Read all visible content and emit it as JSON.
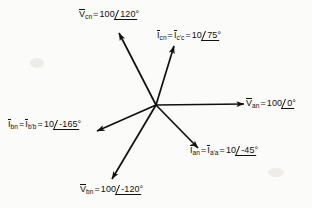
{
  "figure": {
    "type": "phasor-diagram",
    "title": "",
    "origin": {
      "x": 156,
      "y": 105
    },
    "background_color": "#fbfbfa",
    "line_color": "#101010",
    "phasors": [
      {
        "id": "Vcn",
        "quantity": "voltage",
        "symbol": "V",
        "subscript": "cn",
        "magnitude": "100",
        "angle": "120°",
        "label_parts": [
          "V",
          "cn",
          "=",
          "100",
          "120°"
        ],
        "tip": {
          "x": 117,
          "y": 31
        },
        "label_pos": {
          "x": 79,
          "y": 9
        }
      },
      {
        "id": "Icn",
        "quantity": "current",
        "symbol": "I",
        "subscript": "cn",
        "alias_symbol": "I",
        "alias_subscript": "c'c",
        "magnitude": "10",
        "angle": "75°",
        "label_parts": [
          "I",
          "cn",
          "=",
          "I",
          "c'c",
          "=",
          "10",
          "75°"
        ],
        "tip": {
          "x": 173,
          "y": 44
        },
        "label_pos": {
          "x": 157,
          "y": 30
        }
      },
      {
        "id": "Van",
        "quantity": "voltage",
        "symbol": "V",
        "subscript": "an",
        "magnitude": "100",
        "angle": "0°",
        "label_parts": [
          "V",
          "an",
          "=",
          "100",
          "0°"
        ],
        "tip": {
          "x": 243,
          "y": 104
        },
        "label_pos": {
          "x": 245,
          "y": 98
        }
      },
      {
        "id": "Ian",
        "quantity": "current",
        "symbol": "I",
        "subscript": "an",
        "alias_symbol": "I",
        "alias_subscript": "a'a",
        "magnitude": "10",
        "angle": "-45°",
        "label_parts": [
          "I",
          "an",
          "=",
          "I",
          "a'a",
          "=",
          "10",
          "-45°"
        ],
        "tip": {
          "x": 197,
          "y": 147
        },
        "label_pos": {
          "x": 190,
          "y": 145
        }
      },
      {
        "id": "Ibn",
        "quantity": "current",
        "symbol": "I",
        "subscript": "bn",
        "alias_symbol": "I",
        "alias_subscript": "b'b",
        "magnitude": "10",
        "angle": "-165°",
        "label_parts": [
          "I",
          "bn",
          "=",
          "I",
          "b'b",
          "=",
          "10",
          "-165°"
        ],
        "tip": {
          "x": 98,
          "y": 131
        },
        "label_pos": {
          "x": 8,
          "y": 119
        }
      },
      {
        "id": "Vbn",
        "quantity": "voltage",
        "symbol": "V",
        "subscript": "bn",
        "magnitude": "100",
        "angle": "-120°",
        "label_parts": [
          "V",
          "bn",
          "=",
          "100",
          "-120°"
        ],
        "tip": {
          "x": 113,
          "y": 177
        },
        "label_pos": {
          "x": 80,
          "y": 184
        }
      }
    ],
    "tokens": {
      "equals": "=",
      "degree": "°",
      "v_symbol": "V",
      "i_symbol": "I",
      "vcn_sub": "cn",
      "vcn_mag": "100",
      "vcn_ang": "120°",
      "icn_sub": "cn",
      "icn_alias_sub": "c'c",
      "icn_mag": "10",
      "icn_ang": "75°",
      "van_sub": "an",
      "van_mag": "100",
      "van_ang": "0°",
      "ian_sub": "an",
      "ian_alias_sub": "a'a",
      "ian_mag": "10",
      "ian_ang": "-45°",
      "ibn_sub": "bn",
      "ibn_alias_sub": "b'b",
      "ibn_mag": "10",
      "ibn_ang": "-165°",
      "vbn_sub": "bn",
      "vbn_mag": "100",
      "vbn_ang": "-120°"
    }
  }
}
